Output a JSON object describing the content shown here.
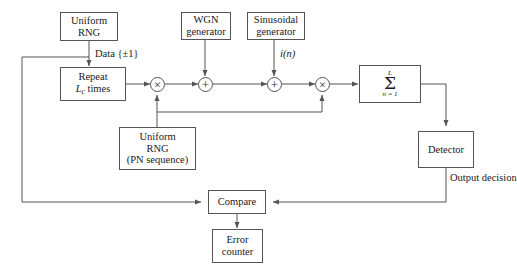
{
  "diagram": {
    "background": "#ffffff",
    "line_color": "#555555"
  },
  "blocks": {
    "uniform_rng": {
      "line1": "Uniform",
      "line2": "RNG"
    },
    "wgn": {
      "line1": "WGN",
      "line2": "generator"
    },
    "sinusoidal": {
      "line1": "Sinusoidal",
      "line2": "generator"
    },
    "repeat": {
      "line1": "Repeat",
      "line2_pre": "L",
      "line2_sub": "c",
      "line2_post": " times"
    },
    "pn_rng": {
      "line1": "Uniform",
      "line2": "RNG",
      "line3": "(PN sequence)"
    },
    "summation": {
      "upper_limit": "L",
      "symbol": "Σ",
      "lower_limit": "n = 1"
    },
    "detector": {
      "label": "Detector"
    },
    "compare": {
      "label": "Compare"
    },
    "error_counter": {
      "line1": "Error",
      "line2": "counter"
    }
  },
  "operators": {
    "multiplier_1": {
      "symbol": "×"
    },
    "adder_1": {
      "symbol": "+"
    },
    "adder_2": {
      "symbol": "+"
    },
    "multiplier_2": {
      "symbol": "×"
    }
  },
  "labels": {
    "data": "Data {±1}",
    "interference": "i(n)",
    "output_decision_l1": "Output",
    "output_decision_l2": "decision"
  }
}
